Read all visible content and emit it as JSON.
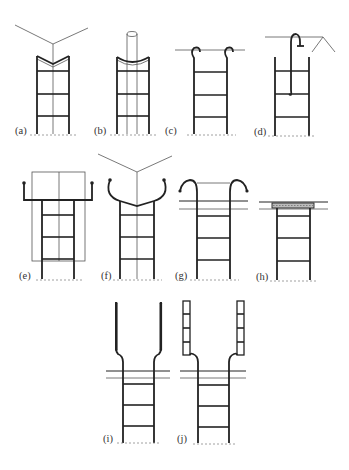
{
  "figure": {
    "type": "ladder-access-configurations",
    "panels": [
      {
        "id": "a",
        "label": "(a)",
        "description": "ladder top with V-notch against corner, guide line up corner"
      },
      {
        "id": "b",
        "label": "(b)",
        "description": "ladder top with curved notch against round pole"
      },
      {
        "id": "c",
        "label": "(c)",
        "description": "ladder with hooks over horizontal bar"
      },
      {
        "id": "d",
        "label": "(d)",
        "description": "ladder with single hook over edge, angled structure"
      },
      {
        "id": "e",
        "label": "(e)",
        "description": "ladder with outrigger arms against flat surface"
      },
      {
        "id": "f",
        "label": "(f)",
        "description": "ladder with curved arms and V top against corner"
      },
      {
        "id": "g",
        "label": "(g)",
        "description": "ladder with curved handrail extensions through opening"
      },
      {
        "id": "h",
        "label": "(h)",
        "description": "ladder with platform at opening"
      },
      {
        "id": "i",
        "label": "(i)",
        "description": "ladder with extended stiles above opening"
      },
      {
        "id": "j",
        "label": "(j)",
        "description": "ladder with extended ladder-section stiles above opening"
      }
    ]
  },
  "colors": {
    "line": "#222222",
    "thin_line": "#555555",
    "ground": "#888888",
    "background": "#ffffff"
  }
}
